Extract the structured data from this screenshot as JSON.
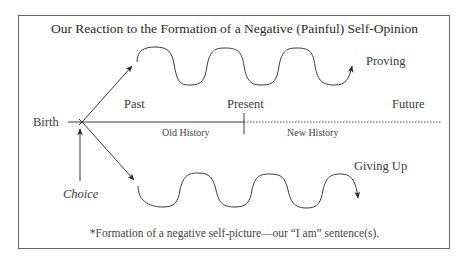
{
  "diagram": {
    "title": "Our Reaction to the Formation of a Negative (Painful) Self-Opinion",
    "labels": {
      "birth": "Birth",
      "past": "Past",
      "present": "Present",
      "future": "Future",
      "old_history": "Old History",
      "new_history": "New History",
      "proving": "Proving",
      "giving_up": "Giving Up",
      "choice": "Choice"
    },
    "footnote": "*Formation of a negative self-picture—our “I am” sentence(s).",
    "colors": {
      "line": "#3a3a3a",
      "frame": "#6a6a6a",
      "background": "#ffffff"
    }
  }
}
